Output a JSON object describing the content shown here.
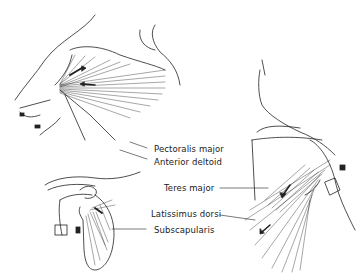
{
  "figure": {
    "panels": [
      {
        "id": "anterior-arm",
        "description": "Anterior view of arm and shoulder, showing pectoralis major and anterior deltoid"
      },
      {
        "id": "scapula",
        "description": "Anterior view of scapula with subscapularis"
      },
      {
        "id": "posterior-shoulder",
        "description": "Posterior shoulder view showing teres major and latissimus dorsi"
      }
    ],
    "labels": {
      "pectoralis_major": "Pectoralis major",
      "anterior_deltoid": "Anterior deltoid",
      "teres_major": "Teres major",
      "latissimus_dorsi": "Latissimus dorsi",
      "subscapularis": "Subscapularis"
    },
    "colors": {
      "ink": "#222222",
      "background": "#ffffff"
    }
  }
}
